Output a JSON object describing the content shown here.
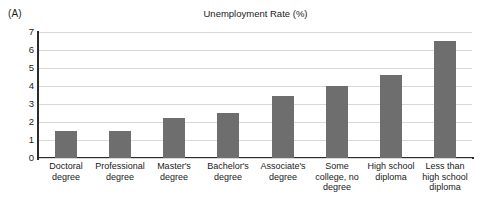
{
  "panel": {
    "label": "(A)"
  },
  "chart_data": {
    "type": "bar",
    "title": "Unemployment Rate (%)",
    "xlabel": "",
    "ylabel": "",
    "ylim": [
      0,
      7
    ],
    "ytick_step": 1,
    "yticks": [
      "7",
      "6",
      "5",
      "4",
      "3",
      "2",
      "1",
      "0"
    ],
    "grid": true,
    "legend": "none",
    "bar_color": "#6e6e6e",
    "categories": [
      "Doctoral degree",
      "Professional degree",
      "Master's degree",
      "Bachelor's degree",
      "Associate's degree",
      "Some college, no degree",
      "High school diploma",
      "Less than high school diploma"
    ],
    "values": [
      1.5,
      1.5,
      2.2,
      2.5,
      3.45,
      4.0,
      4.6,
      6.5
    ]
  }
}
